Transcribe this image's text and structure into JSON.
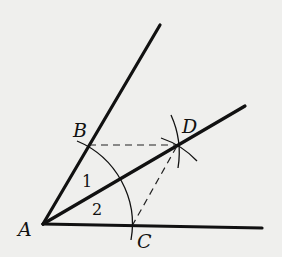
{
  "diagram": {
    "background": "#efefed",
    "stroke": "#111111",
    "points": {
      "A": {
        "label": "A",
        "x": 43,
        "y": 224
      },
      "B": {
        "label": "B",
        "x": 89,
        "y": 145
      },
      "C": {
        "label": "C",
        "x": 132,
        "y": 226
      },
      "D": {
        "label": "D",
        "x": 177,
        "y": 146
      }
    },
    "angle_labels": [
      {
        "label": "1",
        "x": 88,
        "y": 186
      },
      {
        "label": "2",
        "x": 98,
        "y": 216
      }
    ],
    "rays": [
      "AB",
      "AD",
      "AC"
    ],
    "dashed_segments": [
      "BD",
      "CD"
    ],
    "arcs": [
      "arc centered A through B and C",
      "arc centered B near D",
      "arc centered C near D"
    ]
  }
}
